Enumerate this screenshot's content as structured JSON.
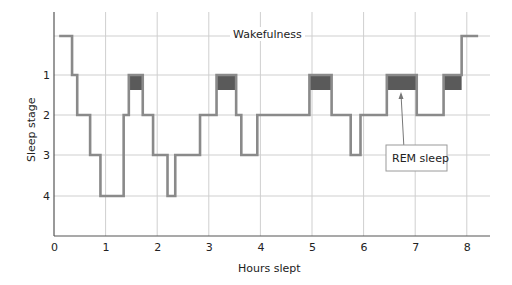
{
  "chart_data": {
    "type": "line",
    "subtype": "step (hypnogram)",
    "title": "",
    "xlabel": "Hours slept",
    "ylabel": "Sleep stage",
    "xlim": [
      0,
      8.3
    ],
    "x_ticks": [
      "0",
      "1",
      "2",
      "3",
      "4",
      "5",
      "6",
      "7",
      "8"
    ],
    "y_levels": [
      {
        "key": "W",
        "label": "Wakefulness",
        "value": 0
      },
      {
        "key": "1",
        "label": "1",
        "value": 1
      },
      {
        "key": "2",
        "label": "2",
        "value": 2
      },
      {
        "key": "3",
        "label": "3",
        "value": 3
      },
      {
        "key": "4",
        "label": "4",
        "value": 4
      }
    ],
    "y_tick_labels": [
      "1",
      "2",
      "3",
      "4"
    ],
    "grid": true,
    "series": [
      {
        "name": "Sleep stage",
        "color": "#8a8a8a",
        "steps": [
          {
            "x": 0.15,
            "stage": 0
          },
          {
            "x": 0.35,
            "stage": 1
          },
          {
            "x": 0.45,
            "stage": 2
          },
          {
            "x": 0.7,
            "stage": 3
          },
          {
            "x": 0.9,
            "stage": 4
          },
          {
            "x": 1.35,
            "stage": 2
          },
          {
            "x": 1.45,
            "stage": "1-REM"
          },
          {
            "x": 1.72,
            "stage": 2
          },
          {
            "x": 1.92,
            "stage": 3
          },
          {
            "x": 2.2,
            "stage": 4
          },
          {
            "x": 2.35,
            "stage": 3
          },
          {
            "x": 2.83,
            "stage": 2
          },
          {
            "x": 3.15,
            "stage": "1-REM"
          },
          {
            "x": 3.53,
            "stage": 2
          },
          {
            "x": 3.63,
            "stage": 3
          },
          {
            "x": 3.94,
            "stage": 2
          },
          {
            "x": 4.95,
            "stage": "1-REM"
          },
          {
            "x": 5.38,
            "stage": 2
          },
          {
            "x": 5.75,
            "stage": 3
          },
          {
            "x": 5.94,
            "stage": 2
          },
          {
            "x": 6.45,
            "stage": "1-REM"
          },
          {
            "x": 7.03,
            "stage": 2
          },
          {
            "x": 7.55,
            "stage": "1-REM"
          },
          {
            "x": 7.9,
            "stage": 0
          },
          {
            "x": 8.22,
            "stage": 0
          }
        ]
      }
    ],
    "rem_periods": [
      {
        "start": 1.45,
        "end": 1.72
      },
      {
        "start": 3.15,
        "end": 3.53
      },
      {
        "start": 4.95,
        "end": 5.38
      },
      {
        "start": 6.45,
        "end": 7.03
      },
      {
        "start": 7.55,
        "end": 7.9
      }
    ],
    "annotations": [
      {
        "text": "Wakefulness",
        "type": "level-label"
      },
      {
        "text": "REM sleep",
        "type": "boxed-callout",
        "points_to_rem_index": 3
      }
    ],
    "colors": {
      "line": "#8a8a8a",
      "rem_fill": "#5a5a5a",
      "grid": "#cfcfcf",
      "axis": "#555555"
    }
  },
  "labels": {
    "wakefulness": "Wakefulness",
    "rem": "REM sleep",
    "xlabel": "Hours slept",
    "ylabel": "Sleep stage"
  }
}
